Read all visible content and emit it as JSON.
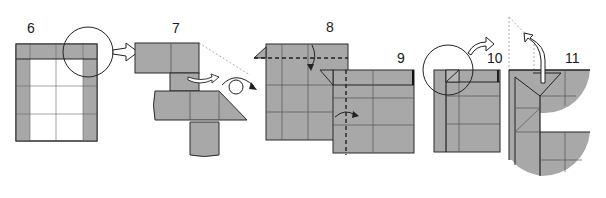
{
  "diagram": {
    "type": "origami-instructions",
    "colors": {
      "paper_colored": "#a8a8a8",
      "paper_white": "#ffffff",
      "outline": "#2a2a2a",
      "crease": "#555555",
      "guide_dotted": "#9a9a9a",
      "arrow_fill": "#ffffff",
      "arrow_stroke": "#222222"
    },
    "steps": [
      {
        "number": "6",
        "description": "Square with colored frame on top, left and right edges; detail circle at top-right corner"
      },
      {
        "number": "7",
        "description": "Enlarged corner detail, flap tucked, then turn over"
      },
      {
        "number": "8",
        "description": "Valley-fold top edge down along dashed line"
      },
      {
        "number": "9",
        "description": "Valley-fold left edge along dashed vertical line"
      },
      {
        "number": "10",
        "description": "Detail circle at top-left corner"
      },
      {
        "number": "11",
        "description": "Pull flap up; enlarged corner detail"
      }
    ],
    "symbols": {
      "enlarge_arrow": "hollow-arrow-right",
      "turn_over": "loop-arrow",
      "valley_fold_line": "dashed",
      "fold_arrow": "curved-arrow"
    }
  }
}
